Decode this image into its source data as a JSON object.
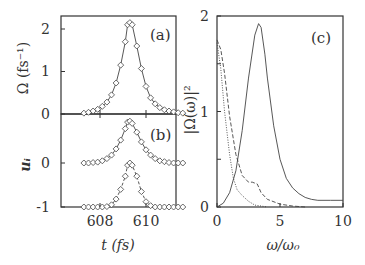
{
  "chart_data": [
    {
      "panel": "a",
      "type": "line",
      "panel_label": "(a)",
      "xlabel": "t (fs)",
      "ylabel": "Ω (fs⁻¹)",
      "xlim": [
        607.2,
        611.7
      ],
      "ylim": [
        0,
        2.3
      ],
      "yticks": [
        "0",
        "1",
        "2"
      ],
      "xticks": [
        "608",
        "610"
      ],
      "series": [
        {
          "name": "Ω(t) line",
          "style": "solid",
          "x": [
            607.3,
            607.5,
            607.7,
            607.9,
            608.1,
            608.3,
            608.5,
            608.7,
            608.9,
            609.1,
            609.2,
            609.3,
            609.4,
            609.6,
            609.8,
            610.0,
            610.2,
            610.4,
            610.6,
            610.8,
            611.0,
            611.2,
            611.4,
            611.6
          ],
          "y": [
            0.02,
            0.04,
            0.07,
            0.11,
            0.18,
            0.28,
            0.45,
            0.73,
            1.15,
            1.7,
            2.1,
            2.15,
            2.1,
            1.6,
            1.07,
            0.65,
            0.38,
            0.24,
            0.15,
            0.1,
            0.07,
            0.05,
            0.03,
            0.02
          ]
        },
        {
          "name": "Ω(t) markers",
          "style": "diamond"
        }
      ]
    },
    {
      "panel": "b",
      "type": "line",
      "panel_label": "(b)",
      "xlabel": "t (fs)",
      "ylabel": "u_i",
      "ylim": [
        -1,
        1.1
      ],
      "yticks": [
        "-1",
        "0"
      ],
      "xticks": [
        "608",
        "610"
      ],
      "series": [
        {
          "name": "upper (solid, offset 0)",
          "style": "solid+diamond",
          "x": [
            607.3,
            607.5,
            607.7,
            607.9,
            608.1,
            608.3,
            608.5,
            608.7,
            608.9,
            609.1,
            609.2,
            609.3,
            609.4,
            609.6,
            609.8,
            610.0,
            610.2,
            610.4,
            610.6,
            610.8,
            611.0,
            611.2,
            611.4,
            611.6
          ],
          "y": [
            0.0,
            0.0,
            0.01,
            0.02,
            0.05,
            0.1,
            0.18,
            0.32,
            0.52,
            0.78,
            0.93,
            0.95,
            0.9,
            0.7,
            0.48,
            0.3,
            0.18,
            0.1,
            0.05,
            0.03,
            0.01,
            0.0,
            0.0,
            0.0
          ]
        },
        {
          "name": "lower (dashed, offset -1)",
          "style": "dashed+diamond",
          "x": [
            607.3,
            607.5,
            607.7,
            607.9,
            608.1,
            608.3,
            608.5,
            608.7,
            608.9,
            609.1,
            609.2,
            609.3,
            609.4,
            609.6,
            609.8,
            610.0,
            610.2,
            610.4,
            610.6,
            610.8,
            611.0,
            611.2,
            611.4,
            611.6
          ],
          "y": [
            -1,
            -1,
            -1,
            -1,
            -1,
            -0.99,
            -0.95,
            -0.82,
            -0.6,
            -0.3,
            -0.05,
            0.0,
            -0.05,
            -0.3,
            -0.65,
            -0.88,
            -0.97,
            -1,
            -1,
            -1,
            -1,
            -1,
            -1,
            -1
          ]
        }
      ]
    },
    {
      "panel": "c",
      "type": "line",
      "panel_label": "(c)",
      "xlabel": "ω/ω₀",
      "ylabel": "|Ω(ω)|²",
      "xlim": [
        0,
        10
      ],
      "ylim": [
        0,
        2
      ],
      "xticks": [
        "0",
        "5",
        "10"
      ],
      "yticks": [
        "0",
        "1",
        "2"
      ],
      "series": [
        {
          "name": "solid",
          "style": "solid",
          "x": [
            0,
            0.5,
            1,
            1.5,
            2,
            2.5,
            3,
            3.3,
            3.5,
            3.8,
            4,
            4.5,
            5,
            5.5,
            6,
            6.5,
            7,
            7.5,
            8,
            9,
            10
          ],
          "y": [
            0,
            0.04,
            0.15,
            0.38,
            0.8,
            1.35,
            1.8,
            1.92,
            1.88,
            1.6,
            1.35,
            0.85,
            0.5,
            0.3,
            0.2,
            0.14,
            0.1,
            0.08,
            0.07,
            0.07,
            0.07
          ]
        },
        {
          "name": "dashed",
          "style": "dashed",
          "x": [
            0,
            0.3,
            0.6,
            1,
            1.5,
            2,
            2.5,
            2.8,
            3.2,
            3.5,
            4,
            5,
            6,
            7
          ],
          "y": [
            1.75,
            1.65,
            1.4,
            0.95,
            0.55,
            0.33,
            0.26,
            0.26,
            0.24,
            0.15,
            0.08,
            0.03,
            0.01,
            0
          ]
        },
        {
          "name": "dotted",
          "style": "dotted",
          "x": [
            0,
            0.3,
            0.6,
            1,
            1.3,
            1.6,
            2,
            2.5,
            3,
            3.5,
            4
          ],
          "y": [
            1.72,
            1.45,
            1.0,
            0.55,
            0.3,
            0.18,
            0.12,
            0.06,
            0.02,
            0.01,
            0
          ]
        }
      ]
    }
  ],
  "labels": {
    "a_panel": "(a)",
    "b_panel": "(b)",
    "c_panel": "(c)",
    "a_ylabel": "Ω (fs⁻¹)",
    "b_ylabel": "uᵢ",
    "c_ylabel": "|Ω(ω)|²",
    "ab_xlabel": "t (fs)",
    "c_xlabel": "ω/ω₀",
    "a_yt0": "0",
    "a_yt1": "1",
    "a_yt2": "2",
    "b_yt0": "0",
    "b_ytm1": "-1",
    "ab_xt608": "608",
    "ab_xt610": "610",
    "c_xt0": "0",
    "c_xt5": "5",
    "c_xt10": "10",
    "c_yt0": "0",
    "c_yt1": "1",
    "c_yt2": "2"
  }
}
